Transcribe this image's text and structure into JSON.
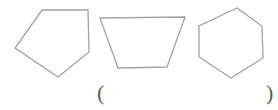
{
  "figure": {
    "background": "#ffffff",
    "stroke_color": "#a2a2a2",
    "stroke_width": 1.3,
    "shapes": [
      {
        "name": "pentagon",
        "sides": 5,
        "points": "42,10 88,10 89,52 58,77 15,48"
      },
      {
        "name": "trapezoid",
        "sides": 4,
        "points": "100,18 185,17 167,67 118,68"
      },
      {
        "name": "hexagon",
        "sides": 6,
        "points": "237,8 262,26 263,58 231,78 199,57 199,26"
      }
    ]
  },
  "answer_blank": {
    "open_paren": "(",
    "close_paren": ")",
    "text_color": "#5c5c5c"
  }
}
